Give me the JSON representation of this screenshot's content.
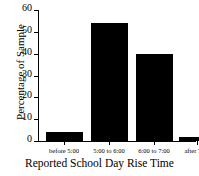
{
  "chart_data": {
    "type": "bar",
    "title": "",
    "xlabel": "Reported School Day Rise Time",
    "ylabel": "Percentage of Sample",
    "categories": [
      "before 5:00",
      "5:00 to 6:00",
      "6:00 to 7:00",
      "after 7:00"
    ],
    "values": [
      4,
      54,
      40,
      2
    ],
    "ylim": [
      0,
      60
    ],
    "yticks": [
      0,
      10,
      20,
      30,
      40,
      50,
      60
    ],
    "ytick_labels": [
      "0",
      "10",
      "20",
      "30",
      "40",
      "50",
      "60"
    ],
    "grid": false,
    "legend": false,
    "bar_color": "#000000",
    "axis_color": "#000000",
    "background": "#ffffff"
  }
}
